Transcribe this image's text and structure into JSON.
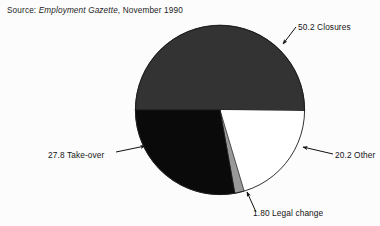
{
  "figure": {
    "source_note": {
      "prefix": "Source: ",
      "italic": "Employment Gazette",
      "suffix": ", November 1990"
    }
  },
  "chart_data": {
    "type": "pie",
    "title": "",
    "subtitle": "",
    "xlabel": "",
    "ylabel": "",
    "legend_position": "none",
    "grid": false,
    "units": "percent",
    "total": 100.0,
    "start_angle_deg": 180,
    "direction": "clockwise",
    "categories": [
      "Closures",
      "Other",
      "Legal change",
      "Take-over"
    ],
    "values": [
      50.2,
      20.2,
      1.8,
      27.8
    ],
    "colors": [
      "#333333",
      "#ffffff",
      "#999999",
      "#0a0a0a"
    ],
    "stroke": "#1a1a1a",
    "slices": [
      {
        "label": "Closures",
        "value": 50.2,
        "value_text": "50.2",
        "annotation": "50.2 Closures",
        "color": "#333333",
        "start_deg": 180.0,
        "end_deg": 360.7
      },
      {
        "label": "Other",
        "value": 20.2,
        "value_text": "20.2",
        "annotation": "20.2 Other",
        "color": "#ffffff",
        "start_deg": 360.7,
        "end_deg": 433.4
      },
      {
        "label": "Legal change",
        "value": 1.8,
        "value_text": "1.80",
        "annotation": "1.80 Legal change",
        "color": "#999999",
        "start_deg": 433.4,
        "end_deg": 439.9
      },
      {
        "label": "Take-over",
        "value": 27.8,
        "value_text": "27.8",
        "annotation": "27.8 Take-over",
        "color": "#0a0a0a",
        "start_deg": 439.9,
        "end_deg": 540.0
      }
    ],
    "annotations": [
      {
        "text": "50.2 Closures",
        "pointer": "down-left"
      },
      {
        "text": "20.2 Other",
        "pointer": "left"
      },
      {
        "text": "27.8 Take-over",
        "pointer": "right"
      },
      {
        "text": "1.80 Legal change",
        "pointer": "up"
      }
    ]
  }
}
